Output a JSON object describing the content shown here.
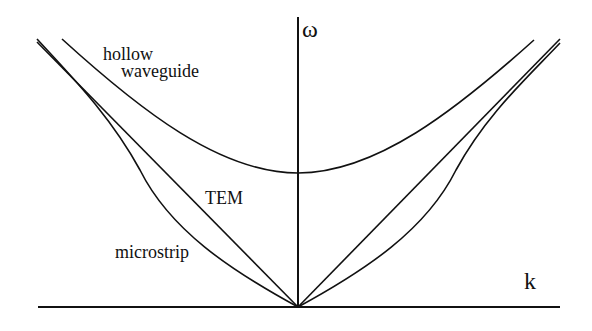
{
  "diagram": {
    "type": "dispersion-relation",
    "axes": {
      "y_label": "ω",
      "x_label": "k"
    },
    "curves": [
      {
        "name": "hollow waveguide",
        "label_line1": "hollow",
        "label_line2": "waveguide",
        "shape": "hyperbola with cutoff frequency"
      },
      {
        "name": "TEM",
        "label": "TEM",
        "shape": "straight line through origin"
      },
      {
        "name": "microstrip",
        "label": "microstrip",
        "shape": "curve through origin bending toward TEM"
      }
    ],
    "colors": {
      "stroke": "#111111",
      "background": "#ffffff"
    }
  }
}
